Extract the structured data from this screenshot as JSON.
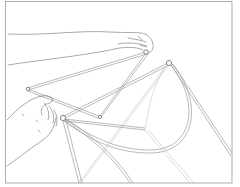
{
  "illustration": {
    "subject": "Two hands assembling a dome tent frame of crossing poles joined at hubs",
    "style": "monochrome line art",
    "colors": {
      "background": "#ffffff",
      "line": "#6e6e6e",
      "frame": "#9a9a9a",
      "light_pole": "#c4c4c4"
    },
    "elements": {
      "upper_hand": "upper-hand",
      "lower_hand": "lower-hand",
      "hubs": [
        "hub-top-right",
        "hub-upper-hand",
        "hub-left",
        "hub-lower-center",
        "hub-middle"
      ],
      "poles": "tent-poles"
    }
  }
}
